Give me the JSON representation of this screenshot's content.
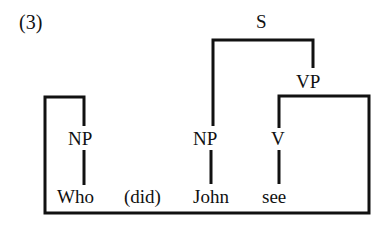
{
  "example_number": "(3)",
  "tree": {
    "root": "S",
    "vp": "VP",
    "nodes": {
      "np_wh": "NP",
      "np_subj": "NP",
      "v": "V"
    },
    "words": [
      "Who",
      "(did)",
      "John",
      "see"
    ]
  },
  "colors": {
    "ink": "#111111",
    "background": "#ffffff"
  }
}
